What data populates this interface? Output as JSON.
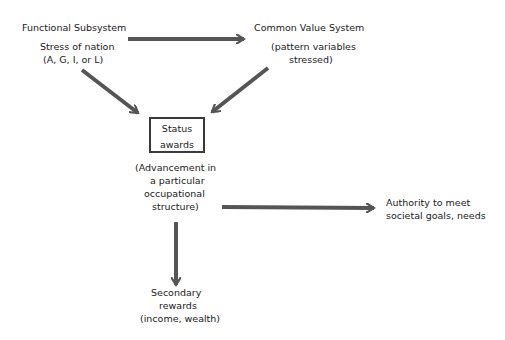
{
  "nodes": {
    "functional": {
      "title": "Functional Subsystem",
      "line1": "Stress of nation",
      "line2": "(A, G, I, or L)"
    },
    "common_value": {
      "title": "Common Value System",
      "line1": "(pattern variables",
      "line2": "stressed)"
    },
    "status": {
      "line1": "Status",
      "line2": "awards"
    },
    "advancement": {
      "line1": "(Advancement in",
      "line2": "a particular",
      "line3": "occupational",
      "line4": "structure)"
    },
    "authority": {
      "line1": "Authority to meet",
      "line2": "societal goals, needs"
    },
    "secondary": {
      "line1": "Secondary",
      "line2": "rewards",
      "line3": "(income, wealth)"
    }
  },
  "edges": [
    {
      "from": "functional",
      "to": "common_value"
    },
    {
      "from": "functional",
      "to": "status"
    },
    {
      "from": "common_value",
      "to": "status"
    },
    {
      "from": "advancement",
      "to": "authority"
    },
    {
      "from": "advancement",
      "to": "secondary"
    }
  ],
  "colors": {
    "arrow": "#555555",
    "text": "#1a1a1a",
    "box_border": "#3a3a3a"
  }
}
